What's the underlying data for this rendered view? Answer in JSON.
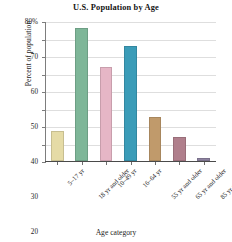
{
  "chart_data": {
    "type": "bar",
    "title": "U.S. Population by Age",
    "xlabel": "Age category",
    "ylabel": "Percent of population",
    "categories": [
      "5–17 yr",
      "18 yr and older",
      "10–49 yr",
      "16–64 yr",
      "55 yr and older",
      "65 yr and older",
      "85 yr and older"
    ],
    "values": [
      17,
      76,
      54,
      66,
      25,
      13.5,
      2
    ],
    "bar_colors": [
      "#e5dba6",
      "#7eb698",
      "#e6b6c6",
      "#3b9cb8",
      "#c09a6b",
      "#b07f8c",
      "#8d82a0"
    ],
    "ylim": [
      0,
      80
    ],
    "yticks": [
      0,
      10,
      20,
      30,
      40,
      50,
      60,
      70,
      80
    ],
    "ytick_labels": [
      "0",
      "10",
      "20",
      "30",
      "40",
      "50",
      "60",
      "70",
      "80%"
    ],
    "grid": true,
    "legend": "none"
  }
}
